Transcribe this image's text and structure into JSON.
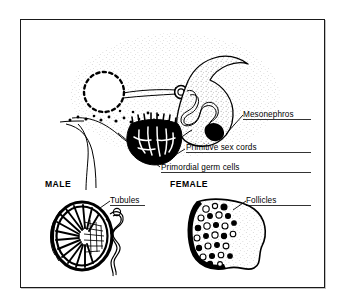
{
  "figure": {
    "background_color": "#ffffff",
    "ink_color": "#000000",
    "frame_color": "#1a1a1a",
    "stipple_color": "#9a9a9a"
  },
  "labels": {
    "mesonephros": "Mesonephros",
    "primitive_sex_cords": "Primitive  sex  cords",
    "primordial_germ_cells": "Primordial  germ  cells",
    "male": "MALE",
    "female": "FEMALE",
    "tubules": "Tubules",
    "follicles": "Follicles"
  },
  "panels": [
    {
      "id": "indifferent-gonad",
      "caption": "",
      "structures": [
        "hindgut",
        "mesonephric-duct",
        "glomerulus",
        "mesonephric-tubule",
        "mesonephros-body",
        "gonadal-ridge",
        "primitive-sex-cords",
        "primordial-germ-cells"
      ]
    },
    {
      "id": "testis",
      "caption": "MALE",
      "structures": [
        "tunica-albuginea",
        "seminiferous-tubules",
        "rete-testis",
        "epididymis",
        "ductus-deferens"
      ]
    },
    {
      "id": "ovary",
      "caption": "FEMALE",
      "structures": [
        "ovarian-cortex",
        "follicles",
        "medulla",
        "hilum"
      ]
    }
  ],
  "icons": {
    "dashed_circle": "hindgut-icon",
    "comma_body": "mesonephros-icon",
    "radial_disc": "testis-icon",
    "follicle_disc": "ovary-icon"
  }
}
